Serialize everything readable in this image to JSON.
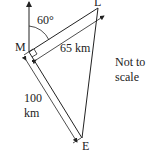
{
  "diagram": {
    "points": {
      "M": {
        "label": "M"
      },
      "E": {
        "label": "E"
      },
      "L": {
        "label": "L"
      }
    },
    "angle_label": "60°",
    "distance_ML": "65 km",
    "distance_ME_value": "100",
    "distance_ME_unit": "km",
    "note_line1": "Not to",
    "note_line2": "scale",
    "colors": {
      "line": "#222222",
      "background": "#ffffff"
    }
  }
}
